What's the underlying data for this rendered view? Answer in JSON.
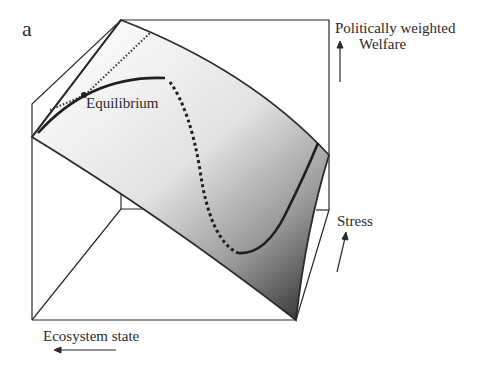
{
  "figure": {
    "panel_label": "a",
    "axes": {
      "vertical": {
        "line1": "Politically weighted",
        "line2": "Welfare"
      },
      "depth": "Stress",
      "horizontal": "Ecosystem state"
    },
    "annotations": {
      "equilibrium": "Equilibrium"
    },
    "legend_styles": {
      "stable_branch": "solid",
      "unstable_branch": "dashed",
      "welfare_ridge": "dotted"
    },
    "colors": {
      "line": "#2a2a2a",
      "surface_light": "#f4f4f4",
      "surface_dark": "#3a3a3a",
      "background": "#ffffff"
    }
  }
}
